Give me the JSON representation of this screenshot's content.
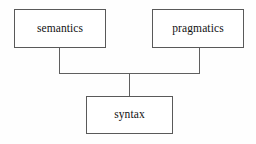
{
  "diagram": {
    "type": "hierarchy-tree",
    "title": "",
    "background_color": "#fefefe",
    "node_border_color": "#595959",
    "node_fill_color": "#ffffff",
    "edge_color": "#5f5f5f",
    "text_color": "#121212",
    "nodes": [
      {
        "id": "semantics",
        "label": "semantics",
        "row": "top",
        "column": "left"
      },
      {
        "id": "pragmatics",
        "label": "pragmatics",
        "row": "top",
        "column": "right"
      },
      {
        "id": "syntax",
        "label": "syntax",
        "row": "bottom",
        "column": "center"
      }
    ],
    "edges": [
      {
        "id": "semantics-to-junction",
        "from": "semantics",
        "to": "junction",
        "style": "orthogonal"
      },
      {
        "id": "pragmatics-to-junction",
        "from": "pragmatics",
        "to": "junction",
        "style": "orthogonal"
      },
      {
        "id": "junction-to-syntax",
        "from": "junction",
        "to": "syntax",
        "style": "orthogonal"
      }
    ]
  }
}
